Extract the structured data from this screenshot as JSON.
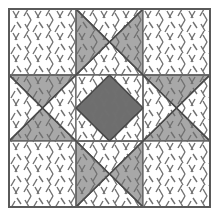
{
  "figure": {
    "kind": "quilt-block-diagram",
    "width": 219,
    "height": 218,
    "background": "#ffffff"
  },
  "palette": {
    "background": "#ffffff",
    "patch_white": "#ffffff",
    "patch_light_gray": "#a8a8a8",
    "patch_dark_gray": "#6e6e6e",
    "grid_line": "#6a6a6a",
    "outer_border": "#5a5a5a",
    "patch_edge": "#4a4a4a",
    "hatch_stroke": "#707070"
  },
  "geometry": {
    "border_left": 9,
    "border_top": 9,
    "border_right": 210,
    "border_bottom": 207,
    "grid_x": [
      9,
      76,
      143,
      210
    ],
    "grid_y": [
      9,
      75,
      141,
      207
    ],
    "outer_border_width": 2.0,
    "grid_line_width": 1.3,
    "patch_edge_width": 1.3
  },
  "hatch": {
    "name": "scattered-dash-texture",
    "stroke": "#707070",
    "stroke_width": 1.4,
    "dash_length": 7,
    "tile": 22,
    "description": "short angled tick marks in alternating left/right lean, scattered over every patch"
  },
  "grid": {
    "rows": 3,
    "cols": 3,
    "cells": [
      {
        "id": "r0c0",
        "name": "corner-top-left",
        "type": "plain",
        "fill": "white"
      },
      {
        "id": "r0c1",
        "name": "edge-top-center",
        "type": "hourglass",
        "orientation": "horizontal-gray",
        "fill_primary": "light_gray",
        "fill_secondary": "white"
      },
      {
        "id": "r0c2",
        "name": "corner-top-right",
        "type": "plain",
        "fill": "white"
      },
      {
        "id": "r1c0",
        "name": "edge-middle-left",
        "type": "hourglass",
        "orientation": "vertical-gray",
        "fill_primary": "light_gray",
        "fill_secondary": "white"
      },
      {
        "id": "r1c1",
        "name": "center-square-on-point",
        "type": "square-on-point",
        "fill_primary": "dark_gray",
        "fill_secondary": "white"
      },
      {
        "id": "r1c2",
        "name": "edge-middle-right",
        "type": "hourglass",
        "orientation": "vertical-gray",
        "fill_primary": "light_gray",
        "fill_secondary": "white"
      },
      {
        "id": "r2c0",
        "name": "corner-bottom-left",
        "type": "plain",
        "fill": "white"
      },
      {
        "id": "r2c1",
        "name": "edge-bottom-center",
        "type": "hourglass",
        "orientation": "horizontal-gray",
        "fill_primary": "light_gray",
        "fill_secondary": "white"
      },
      {
        "id": "r2c2",
        "name": "corner-bottom-right",
        "type": "plain",
        "fill": "white"
      }
    ]
  },
  "star": {
    "points": 8,
    "point_color": "light_gray",
    "center_color": "dark_gray",
    "background_color": "white"
  }
}
